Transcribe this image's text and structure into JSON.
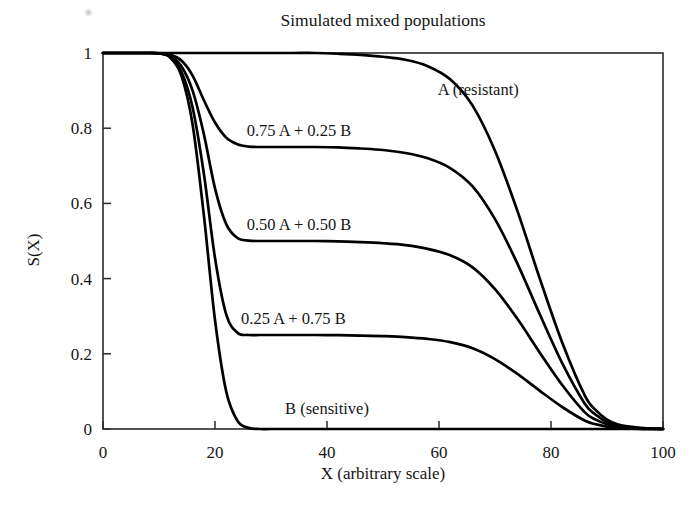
{
  "figure": {
    "title": "Simulated mixed populations",
    "x_axis_label": "X (arbitrary scale)",
    "y_axis_label": "S(X)"
  },
  "chart_data": {
    "type": "line",
    "title": "Simulated mixed populations",
    "xlabel": "X (arbitrary scale)",
    "ylabel": "S(X)",
    "xlim": [
      0,
      100
    ],
    "ylim": [
      0,
      1
    ],
    "grid": false,
    "legend": "inline-curve-labels",
    "xticks": [
      0,
      20,
      40,
      60,
      80,
      100
    ],
    "xtick_labels": [
      "0",
      "20",
      "40",
      "60",
      "80",
      "100"
    ],
    "yticks": [
      0,
      0.2,
      0.4,
      0.6,
      0.8,
      1
    ],
    "ytick_labels": [
      "0",
      "0.2",
      "0.4",
      "0.6",
      "0.8",
      "1"
    ],
    "x": [
      0,
      4,
      8,
      10,
      12,
      14,
      16,
      18,
      20,
      22,
      24,
      26,
      28,
      30,
      34,
      38,
      42,
      46,
      50,
      54,
      58,
      62,
      66,
      70,
      74,
      78,
      82,
      86,
      88,
      90,
      92,
      96,
      100
    ],
    "series": [
      {
        "name": "A (resistant)",
        "label": "A (resistant)",
        "plateau": 1.0,
        "label_x": 67,
        "label_y": 0.905,
        "values": [
          1,
          1,
          1,
          1,
          1,
          1,
          1,
          1,
          1,
          1,
          1,
          1,
          1,
          1,
          1,
          1,
          0.998,
          0.995,
          0.99,
          0.982,
          0.965,
          0.93,
          0.86,
          0.74,
          0.58,
          0.4,
          0.23,
          0.09,
          0.05,
          0.025,
          0.012,
          0.003,
          0.0
        ]
      },
      {
        "name": "0.75 A + 0.25 B",
        "label": "0.75 A + 0.25 B",
        "plateau": 0.75,
        "label_x": 35,
        "label_y": 0.795,
        "values": [
          1,
          1,
          1,
          0.999,
          0.995,
          0.98,
          0.94,
          0.875,
          0.815,
          0.775,
          0.757,
          0.751,
          0.75,
          0.75,
          0.75,
          0.75,
          0.749,
          0.746,
          0.742,
          0.734,
          0.72,
          0.694,
          0.645,
          0.558,
          0.44,
          0.305,
          0.175,
          0.068,
          0.038,
          0.019,
          0.009,
          0.002,
          0.0
        ]
      },
      {
        "name": "0.50 A + 0.50 B",
        "label": "0.50 A + 0.50 B",
        "plateau": 0.5,
        "label_x": 35,
        "label_y": 0.545,
        "values": [
          1,
          1,
          1,
          0.999,
          0.993,
          0.965,
          0.9,
          0.785,
          0.64,
          0.545,
          0.508,
          0.501,
          0.5,
          0.5,
          0.5,
          0.5,
          0.499,
          0.497,
          0.494,
          0.489,
          0.479,
          0.462,
          0.43,
          0.372,
          0.293,
          0.203,
          0.117,
          0.045,
          0.025,
          0.013,
          0.006,
          0.001,
          0.0
        ]
      },
      {
        "name": "0.25 A + 0.75 B",
        "label": "0.25 A + 0.75 B",
        "plateau": 0.25,
        "label_x": 34,
        "label_y": 0.295,
        "values": [
          1,
          1,
          1,
          0.999,
          0.99,
          0.95,
          0.855,
          0.68,
          0.455,
          0.305,
          0.256,
          0.25,
          0.25,
          0.25,
          0.25,
          0.25,
          0.2495,
          0.2485,
          0.247,
          0.2445,
          0.2395,
          0.231,
          0.215,
          0.186,
          0.1465,
          0.1015,
          0.0585,
          0.0225,
          0.0125,
          0.0065,
          0.003,
          0.0005,
          0.0
        ]
      },
      {
        "name": "B (sensitive)",
        "label": "B (sensitive)",
        "plateau": 0.0,
        "label_x": 40,
        "label_y": 0.055,
        "values": [
          1,
          1,
          1,
          0.999,
          0.988,
          0.94,
          0.81,
          0.57,
          0.29,
          0.1,
          0.022,
          0.003,
          0,
          0,
          0,
          0,
          0,
          0,
          0,
          0,
          0,
          0,
          0,
          0,
          0,
          0,
          0,
          0,
          0,
          0,
          0,
          0,
          0
        ]
      }
    ]
  }
}
